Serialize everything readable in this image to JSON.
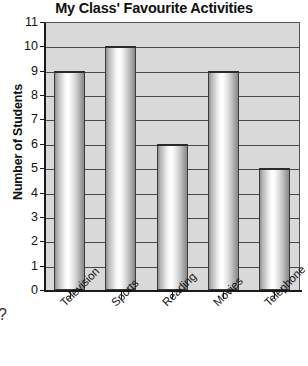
{
  "chart_data": {
    "type": "bar",
    "title": "My Class' Favourite Activities",
    "xlabel": "",
    "ylabel": "Number of Students",
    "categories": [
      "Television",
      "Sports",
      "Reading",
      "Movies",
      "Telephone"
    ],
    "values": [
      9,
      10,
      6,
      9,
      5
    ],
    "ylim": [
      0,
      11
    ],
    "ytick_labels": [
      "11",
      "10",
      "9",
      "8",
      "7",
      "6",
      "5",
      "4",
      "3",
      "2",
      "1",
      "0"
    ],
    "ytick_values": [
      11,
      10,
      9,
      8,
      7,
      6,
      5,
      4,
      3,
      2,
      1,
      0
    ],
    "grid": true,
    "legend": null,
    "plot_background_color": "#d9d9d9",
    "bar_edge_color": "#3a3a3a",
    "axis_color": "#1a1a1a",
    "text_color": "#111111",
    "series": [
      {
        "name": "Number of Students",
        "values": [
          9,
          10,
          6,
          9,
          5
        ]
      }
    ]
  },
  "annotations": {
    "clipped_edge_glyph": "?"
  }
}
